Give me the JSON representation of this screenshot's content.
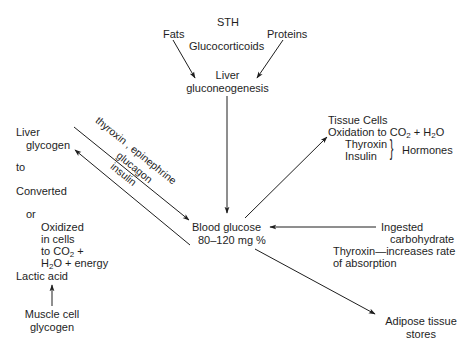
{
  "diagram": {
    "nodes": {
      "sth": "STH",
      "fats": "Fats",
      "proteins": "Proteins",
      "glucocorticoids": "Glucocorticoids",
      "liver_gluco_1": "Liver",
      "liver_gluco_2": "gluconeogenesis",
      "liver_glycogen_1": "Liver",
      "liver_glycogen_2": "glycogen",
      "to": "to",
      "converted": "Converted",
      "or": "or",
      "oxidized_1": "Oxidized",
      "oxidized_2": "in cells",
      "oxidized_3a": "to CO",
      "oxidized_3b": "2",
      "oxidized_3c": " +",
      "oxidized_4a": "H",
      "oxidized_4b": "2",
      "oxidized_4c": "O + energy",
      "lactic_acid": "Lactic acid",
      "muscle_1": "Muscle cell",
      "muscle_2": "glycogen",
      "blood_glucose_1": "Blood glucose",
      "blood_glucose_2": "80–120 mg %",
      "tissue_1": "Tissue Cells",
      "tissue_2a": "Oxidation to CO",
      "tissue_2b": "2",
      "tissue_2c": " + H",
      "tissue_2d": "2",
      "tissue_2e": "O",
      "thyroxin": "Thyroxin",
      "insulin": "Insulin",
      "hormones": "Hormones",
      "ingested_1": "Ingested",
      "ingested_2": "carbohydrate",
      "ingested_3": "Thyroxin—increases rate",
      "ingested_4": "of absorption",
      "adipose_1": "Adipose tissue",
      "adipose_2": "stores"
    },
    "edge_labels": {
      "upper": "thyroxin , epinephrine",
      "lower_1": "glucagon",
      "lower_2": "insulin"
    },
    "edges": [
      {
        "from": "Fats",
        "to": "Liver gluconeogenesis"
      },
      {
        "from": "Proteins",
        "to": "Liver gluconeogenesis"
      },
      {
        "from": "Liver gluconeogenesis",
        "to": "Blood glucose"
      },
      {
        "from": "Liver glycogen",
        "to": "Blood glucose",
        "label": "thyroxin, epinephrine"
      },
      {
        "from": "Blood glucose",
        "to": "Liver glycogen",
        "label": "glucagon, insulin"
      },
      {
        "from": "Blood glucose",
        "to": "Tissue Cells"
      },
      {
        "from": "Ingested carbohydrate",
        "to": "Blood glucose"
      },
      {
        "from": "Blood glucose",
        "to": "Adipose tissue stores"
      },
      {
        "from": "Muscle cell glycogen",
        "to": "Lactic acid"
      }
    ],
    "colors": {
      "ink": "#1e1e1e",
      "background": "#ffffff"
    }
  }
}
